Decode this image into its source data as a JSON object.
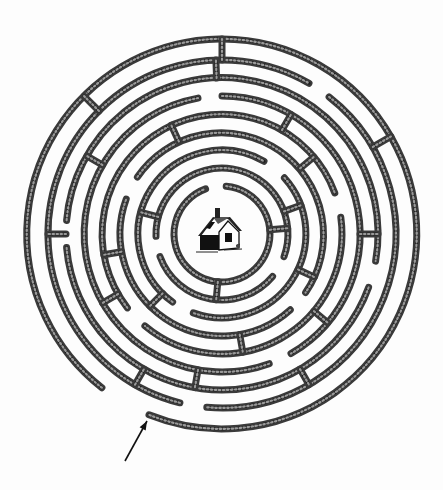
{
  "image": {
    "title": "",
    "description": "Circular hedge maze with a cottage at the center and an arrow marking the entrance"
  },
  "colors": {
    "background": "#fdfdfd",
    "hedge": "#3a3a3a",
    "hedge_light": "#9a9a9a",
    "ink": "#111111"
  },
  "maze": {
    "center": [
      222,
      234
    ],
    "rings": [
      {
        "r": 48,
        "gaps": [
          [
            250,
            275
          ]
        ]
      },
      {
        "r": 66,
        "gaps": [
          [
            20,
            40
          ],
          [
            160,
            178
          ]
        ]
      },
      {
        "r": 84,
        "gaps": [
          [
            300,
            318
          ],
          [
            110,
            126
          ]
        ]
      },
      {
        "r": 102,
        "gaps": [
          [
            200,
            214
          ],
          [
            35,
            48
          ]
        ]
      },
      {
        "r": 120,
        "gaps": [
          [
            130,
            142
          ],
          [
            340,
            352
          ]
        ]
      },
      {
        "r": 138,
        "gaps": [
          [
            260,
            270
          ],
          [
            60,
            70
          ]
        ]
      },
      {
        "r": 156,
        "gaps": [
          [
            175,
            185
          ],
          [
            10,
            20
          ]
        ]
      },
      {
        "r": 174,
        "gaps": [
          [
            300,
            308
          ],
          [
            95,
            104
          ]
        ]
      },
      {
        "r": 195,
        "gaps": [
          [
            112,
            128
          ]
        ]
      }
    ],
    "connectors": [
      {
        "a": 270,
        "r1": 174,
        "r2": 195
      },
      {
        "a": 268,
        "r1": 156,
        "r2": 174
      },
      {
        "a": 300,
        "r1": 120,
        "r2": 138
      },
      {
        "a": 245,
        "r1": 102,
        "r2": 120
      },
      {
        "a": 210,
        "r1": 138,
        "r2": 156
      },
      {
        "a": 195,
        "r1": 66,
        "r2": 84
      },
      {
        "a": 180,
        "r1": 156,
        "r2": 174
      },
      {
        "a": 170,
        "r1": 102,
        "r2": 120
      },
      {
        "a": 150,
        "r1": 120,
        "r2": 138
      },
      {
        "a": 135,
        "r1": 84,
        "r2": 102
      },
      {
        "a": 100,
        "r1": 138,
        "r2": 156
      },
      {
        "a": 95,
        "r1": 48,
        "r2": 66
      },
      {
        "a": 80,
        "r1": 102,
        "r2": 120
      },
      {
        "a": 60,
        "r1": 156,
        "r2": 174
      },
      {
        "a": 40,
        "r1": 120,
        "r2": 138
      },
      {
        "a": 25,
        "r1": 84,
        "r2": 102
      },
      {
        "a": 0,
        "r1": 138,
        "r2": 156
      },
      {
        "a": 340,
        "r1": 66,
        "r2": 84
      },
      {
        "a": 330,
        "r1": 174,
        "r2": 195
      },
      {
        "a": 320,
        "r1": 102,
        "r2": 120
      },
      {
        "a": 225,
        "r1": 174,
        "r2": 195
      },
      {
        "a": 120,
        "r1": 174,
        "r2": 156
      },
      {
        "a": 355,
        "r1": 48,
        "r2": 66
      }
    ]
  },
  "house": {
    "position": [
      222,
      234
    ],
    "label": ""
  },
  "arrow": {
    "from": [
      125,
      461
    ],
    "to": [
      147,
      421
    ],
    "meaning": "entrance"
  }
}
